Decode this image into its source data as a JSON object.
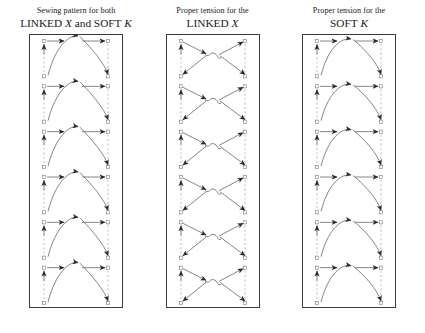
{
  "figure": {
    "title_semantic": "sewing-pattern-tension-diagram",
    "panel_count": 3,
    "repeat_units_per_panel": 6,
    "colors": {
      "background": "#ffffff",
      "box_border": "#3a3a3a",
      "thread": "#5d5d5d",
      "rail_dashed": "#8e8e8e",
      "arrowhead": "#2b2b2b",
      "node_stroke": "#6b6b6b",
      "text": "#181818"
    }
  },
  "panels": [
    {
      "id": "sewing-pattern-both",
      "caption_line1": "Sewing pattern for both",
      "caption_line2_parts": [
        {
          "text": "LINKED ",
          "italic": false
        },
        {
          "text": "X",
          "italic": true
        },
        {
          "text": " and SOFT ",
          "italic": false
        },
        {
          "text": "K",
          "italic": true
        }
      ],
      "caption_line2_plain": "LINKED X and SOFT K",
      "pattern_type": "arch",
      "box": {
        "width": 92,
        "height": 272
      }
    },
    {
      "id": "proper-tension-linked-x",
      "caption_line1": "Proper tension for the",
      "caption_line2_parts": [
        {
          "text": "LINKED ",
          "italic": false
        },
        {
          "text": "X",
          "italic": true
        }
      ],
      "caption_line2_plain": "LINKED X",
      "pattern_type": "crossed-x",
      "box": {
        "width": 92,
        "height": 272
      }
    },
    {
      "id": "proper-tension-soft-k",
      "caption_line1": "Proper tension for the",
      "caption_line2_parts": [
        {
          "text": "SOFT ",
          "italic": false
        },
        {
          "text": "K",
          "italic": true
        }
      ],
      "caption_line2_plain": "SOFT K",
      "pattern_type": "soft-arch",
      "box": {
        "width": 92,
        "height": 272
      }
    }
  ]
}
